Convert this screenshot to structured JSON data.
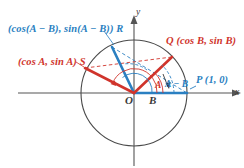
{
  "figure": {
    "colors": {
      "blue": "#2a7fc1",
      "red": "#d0342c",
      "axis": "#555555",
      "circle": "#4a4a4a",
      "background": "#ffffff"
    }
  },
  "axes": {
    "x_label": "x",
    "y_label": "y",
    "origin_label": "O"
  },
  "points": {
    "r": "(cos(A − B), sin(A − B)) R",
    "s": "(cos A, sin A) S",
    "q": "Q (cos B, sin B)",
    "p": "P (1, 0)"
  },
  "angles": {
    "a": "A",
    "b": "B",
    "a_minus_b": "A − B"
  },
  "geometry": {
    "origin_x": 134,
    "origin_y": 93,
    "radius": 53,
    "point_p": [
      187,
      93
    ],
    "point_q": [
      172,
      57
    ],
    "point_r": [
      112,
      47
    ],
    "point_s": [
      85,
      68
    ]
  }
}
